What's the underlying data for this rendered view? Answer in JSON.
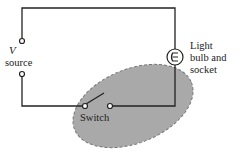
{
  "diagram": {
    "labels": {
      "source_symbol": "V",
      "source": "source",
      "bulb_line1": "Light",
      "bulb_line2": "bulb and",
      "bulb_line3": "socket",
      "switch": "Switch"
    },
    "colors": {
      "wire": "#222222",
      "highlight_fill": "#a9a9a9",
      "highlight_stroke": "#777777",
      "background": "#ffffff"
    },
    "components": [
      "voltage source",
      "switch (open)",
      "light bulb and socket"
    ],
    "highlight": "shaded dashed ellipse around switch and bottom-right wire"
  }
}
